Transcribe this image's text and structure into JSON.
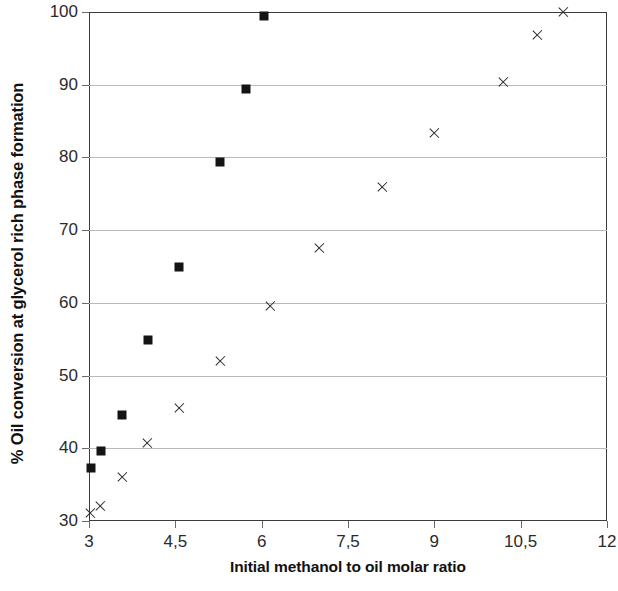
{
  "chart_data": {
    "type": "scatter",
    "title": "",
    "xlabel": "Initial methanol to oil molar ratio",
    "ylabel": "% Oil conversion at glycerol rich phase formation",
    "xlim": [
      3,
      12
    ],
    "ylim": [
      30,
      100
    ],
    "grid": true,
    "grid_axis": "y",
    "legend": "none",
    "decimal_separator": ",",
    "x_ticks": [
      3,
      4.5,
      6,
      7.5,
      9,
      10.5,
      12
    ],
    "x_tick_labels": [
      "3",
      "4,5",
      "6",
      "7,5",
      "9",
      "10,5",
      "12"
    ],
    "y_ticks": [
      30,
      40,
      50,
      60,
      70,
      80,
      90,
      100
    ],
    "y_tick_labels": [
      "30",
      "40",
      "50",
      "60",
      "70",
      "80",
      "90",
      "100"
    ],
    "series": [
      {
        "name": "series-squares",
        "marker": "square",
        "color": "#141414",
        "points": [
          {
            "x": 3.03,
            "y": 37.3
          },
          {
            "x": 3.21,
            "y": 39.6
          },
          {
            "x": 3.58,
            "y": 44.6
          },
          {
            "x": 4.02,
            "y": 54.9
          },
          {
            "x": 4.57,
            "y": 65.0
          },
          {
            "x": 5.27,
            "y": 79.4
          },
          {
            "x": 5.72,
            "y": 89.4
          },
          {
            "x": 6.04,
            "y": 99.4
          }
        ]
      },
      {
        "name": "series-crosses",
        "marker": "cross",
        "color": "#2a2a2a",
        "points": [
          {
            "x": 3.03,
            "y": 31.1
          },
          {
            "x": 3.2,
            "y": 32.0
          },
          {
            "x": 3.58,
            "y": 36.1
          },
          {
            "x": 4.01,
            "y": 40.7
          },
          {
            "x": 4.58,
            "y": 45.5
          },
          {
            "x": 5.29,
            "y": 52.0
          },
          {
            "x": 6.15,
            "y": 59.6
          },
          {
            "x": 7.0,
            "y": 67.6
          },
          {
            "x": 8.1,
            "y": 75.9
          },
          {
            "x": 9.0,
            "y": 83.4
          },
          {
            "x": 10.2,
            "y": 90.4
          },
          {
            "x": 10.8,
            "y": 96.8
          },
          {
            "x": 11.25,
            "y": 100.0
          }
        ]
      }
    ]
  }
}
